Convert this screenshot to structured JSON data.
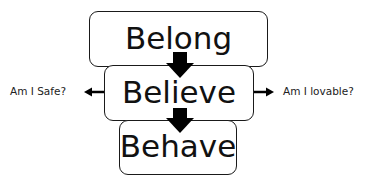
{
  "diagram": {
    "boxes": [
      {
        "id": "belong",
        "label": "Belong"
      },
      {
        "id": "believe",
        "label": "Believe"
      },
      {
        "id": "behave",
        "label": "Behave"
      }
    ],
    "side_labels": {
      "left": "Am I Safe?",
      "right": "Am I lovable?"
    },
    "colors": {
      "stroke": "#1a1a1a",
      "text": "#111111",
      "background": "#ffffff"
    }
  }
}
